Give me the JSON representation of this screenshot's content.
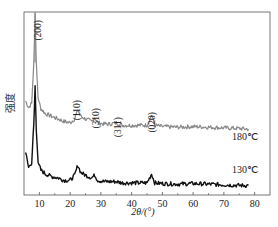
{
  "chart_data": {
    "type": "line",
    "title": "",
    "xlabel": "2θ/(°)",
    "ylabel": "强度",
    "xlim": [
      5,
      85
    ],
    "ylim": [
      0,
      100
    ],
    "x_ticks": [
      10,
      20,
      30,
      40,
      50,
      60,
      70,
      80
    ],
    "y_ticks": [],
    "grid": false,
    "legend": "inline labels at right end of curves",
    "series": [
      {
        "name": "180℃",
        "color": "#888888",
        "offset": 38,
        "x": [
          5.5,
          6.5,
          7.5,
          8.2,
          8.6,
          9.0,
          9.6,
          10.5,
          12,
          14,
          16,
          18,
          20,
          21.5,
          22.5,
          23.5,
          25,
          27,
          28,
          29,
          31,
          33,
          35,
          37,
          40,
          43,
          45,
          46.5,
          47.5,
          50,
          55,
          60,
          65,
          70,
          75,
          78
        ],
        "values": [
          30,
          25,
          28,
          60,
          98,
          60,
          32,
          24,
          20,
          18,
          16,
          14,
          13,
          16,
          23,
          18,
          16,
          14,
          17,
          13,
          12,
          12,
          13,
          11,
          11,
          11,
          11,
          19,
          11,
          10,
          9.5,
          10,
          9.5,
          9,
          8.5,
          8
        ]
      },
      {
        "name": "130℃",
        "color": "#111111",
        "offset": 0,
        "x": [
          5.5,
          6.5,
          7.5,
          8.2,
          8.6,
          9.0,
          9.6,
          10.5,
          12,
          14,
          16,
          18,
          20,
          21.5,
          22.5,
          23.5,
          25,
          27,
          28,
          29,
          31,
          33,
          35,
          37,
          40,
          43,
          45,
          46.5,
          47.5,
          50,
          55,
          60,
          65,
          70,
          75,
          78
        ],
        "values": [
          28,
          16,
          20,
          50,
          80,
          45,
          20,
          14,
          11,
          9,
          8,
          6,
          6,
          10,
          18,
          12,
          10,
          8,
          10,
          6,
          5,
          5,
          5,
          4,
          4,
          4,
          4,
          11,
          4,
          3.5,
          3,
          3.5,
          3,
          2.5,
          2,
          2
        ]
      }
    ],
    "annotations": [
      {
        "text": "(200)",
        "x": 9.5,
        "rotated": true
      },
      {
        "text": "(110)",
        "x": 22.3,
        "rotated": true
      },
      {
        "text": "(310)",
        "x": 28.5,
        "rotated": true
      },
      {
        "text": "(311)",
        "x": 35.5,
        "rotated": true
      },
      {
        "text": "(020)",
        "x": 46.7,
        "rotated": true
      }
    ],
    "series_labels": [
      {
        "text": "180℃",
        "series": 0
      },
      {
        "text": "130℃",
        "series": 1
      }
    ]
  },
  "axes": {
    "x_label": "2θ/(°)",
    "y_label": "强度"
  }
}
